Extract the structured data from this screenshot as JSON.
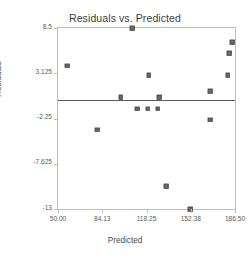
{
  "chart_data": {
    "type": "scatter",
    "title": "Residuals vs. Predicted",
    "xlabel": "Predicted",
    "ylabel": "Residuals",
    "xlim": [
      50.0,
      186.5
    ],
    "ylim": [
      -13.0,
      8.5
    ],
    "xticks": [
      "50.00",
      "84.13",
      "118.25",
      "152.38",
      "186.50"
    ],
    "xtick_values": [
      50.0,
      84.13,
      118.25,
      152.38,
      186.5
    ],
    "yticks": [
      "8.5",
      "3.125",
      "-2.25",
      "-7.625",
      "-13"
    ],
    "ytick_values": [
      8.5,
      3.125,
      -2.25,
      -7.625,
      -13
    ],
    "grid": false,
    "legend": null,
    "reference_line": {
      "orientation": "horizontal",
      "value": 0,
      "color": "#5a5a5a"
    },
    "marker": {
      "shape": "square",
      "color": "#6e6e6e",
      "edge_color": "#4f4f4f",
      "size": 4.6
    },
    "points": [
      {
        "x": 57.0,
        "y": 4.0
      },
      {
        "x": 80.2,
        "y": -3.6
      },
      {
        "x": 107.0,
        "y": 8.5
      },
      {
        "x": 98.4,
        "y": 0.3
      },
      {
        "x": 120.0,
        "y": 2.9
      },
      {
        "x": 111.0,
        "y": -1.1
      },
      {
        "x": 119.2,
        "y": -1.1
      },
      {
        "x": 127.0,
        "y": -1.1
      },
      {
        "x": 128.0,
        "y": 0.3
      },
      {
        "x": 133.4,
        "y": -10.3
      },
      {
        "x": 152.0,
        "y": -13.0
      },
      {
        "x": 167.6,
        "y": 1.0
      },
      {
        "x": 167.6,
        "y": -2.4
      },
      {
        "x": 181.0,
        "y": 2.9
      },
      {
        "x": 182.0,
        "y": 5.5
      },
      {
        "x": 184.5,
        "y": 6.8
      }
    ]
  },
  "colors": {
    "frame": "#bdbdbd",
    "text": "#4a4a4a",
    "marker": "#6e6e6e",
    "reference_line": "#5a5a5a",
    "background": "#ffffff"
  }
}
